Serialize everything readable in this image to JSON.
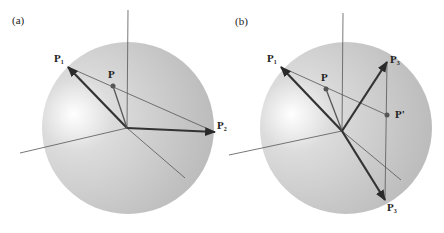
{
  "figure": {
    "panels": [
      {
        "id": "a",
        "tag": "(a)",
        "sphere": {
          "cx": 128,
          "cy": 128,
          "r": 86
        },
        "origin": [
          127,
          128
        ],
        "axes": [
          {
            "name": "vertical-axis",
            "from": [
              128,
              10
            ],
            "to": [
              127,
              128
            ]
          },
          {
            "name": "left-axis",
            "from": [
              127,
              128
            ],
            "to": [
              20,
              153
            ]
          },
          {
            "name": "diagonal-axis",
            "from": [
              127,
              128
            ],
            "to": [
              185,
              178
            ]
          }
        ],
        "points": {
          "P1": {
            "label": "P",
            "sub": "1",
            "pos": [
              68,
              67
            ]
          },
          "P": {
            "label": "P",
            "sub": "",
            "pos": [
              113,
              86
            ]
          },
          "P2": {
            "label": "P",
            "sub": "2",
            "pos": [
              215,
              132
            ]
          }
        },
        "lines": [
          {
            "name": "line-p1-p2",
            "from": "P1",
            "to": "P2"
          }
        ],
        "vectors": [
          {
            "name": "vector-p1",
            "to": "P1",
            "weight": "thick"
          },
          {
            "name": "vector-p",
            "to": "P",
            "weight": "thin"
          },
          {
            "name": "vector-p2",
            "to": "P2",
            "weight": "thick"
          }
        ]
      },
      {
        "id": "b",
        "tag": "(b)",
        "sphere": {
          "cx": 346,
          "cy": 128,
          "r": 86
        },
        "origin": [
          342,
          131
        ],
        "axes": [
          {
            "name": "vertical-axis",
            "from": [
              343,
              13
            ],
            "to": [
              342,
              131
            ]
          },
          {
            "name": "left-axis",
            "from": [
              342,
              131
            ],
            "to": [
              229,
              155
            ]
          },
          {
            "name": "diagonal-axis",
            "from": [
              342,
              131
            ],
            "to": [
              401,
              180
            ]
          }
        ],
        "points": {
          "P1": {
            "label": "P",
            "sub": "1",
            "pos": [
              281,
              67
            ]
          },
          "P": {
            "label": "P",
            "sub": "",
            "pos": [
              326,
              89
            ]
          },
          "P3": {
            "label": "P",
            "sub": "3",
            "pos": [
              387,
              62
            ]
          },
          "Pprime": {
            "label": "P'",
            "sub": "",
            "pos": [
              387,
              115
            ]
          },
          "P3b": {
            "label": "P",
            "sub": "3",
            "pos": [
              385,
              200
            ]
          }
        },
        "lines": [
          {
            "name": "line-p1-pprime",
            "from": "P1",
            "to": "Pprime"
          },
          {
            "name": "line-p3-p3b",
            "from": "P3",
            "to": "P3b"
          }
        ],
        "vectors": [
          {
            "name": "vector-p1",
            "to": "P1",
            "weight": "thick"
          },
          {
            "name": "vector-p",
            "to": "P",
            "weight": "thin"
          },
          {
            "name": "vector-p3",
            "to": "P3",
            "weight": "thick"
          },
          {
            "name": "vector-p3b",
            "to": "P3b",
            "weight": "thick"
          }
        ]
      }
    ],
    "colors": {
      "sphere_light": "#f4f4f4",
      "sphere_mid": "#c9c9c9",
      "sphere_dark": "#a9a9a9",
      "thick_vector": "#333333",
      "thin_vector": "#555555",
      "axis": "#555555",
      "point": "#555555"
    }
  }
}
